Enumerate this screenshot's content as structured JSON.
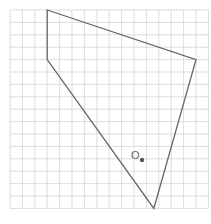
{
  "diagram": {
    "grid": {
      "cols": 16,
      "rows": 16,
      "origin_x": 10,
      "origin_y": 10,
      "cell": 12.4,
      "color": "#d4d4d4"
    },
    "polygon": {
      "vertices": [
        [
          3,
          0
        ],
        [
          15,
          4
        ],
        [
          11.6,
          16
        ],
        [
          3,
          4
        ]
      ],
      "stroke": "#666666"
    },
    "point": {
      "label": "O",
      "x": 10.65,
      "y": 12.1,
      "color": "#555555"
    }
  }
}
